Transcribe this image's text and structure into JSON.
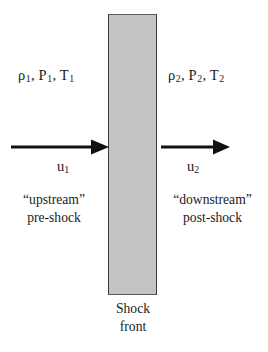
{
  "figure": {
    "background_color": "#ffffff",
    "ink_color": "#1a1a1a"
  },
  "shock_front": {
    "fill_color": "#c4c4c4",
    "edge_color": "#3a3a3a",
    "caption_line1": "Shock",
    "caption_line2": "front"
  },
  "upstream": {
    "state_rho": "ρ",
    "state_rho_sub": "1",
    "state_p": "P",
    "state_p_sub": "1",
    "state_t": "T",
    "state_t_sub": "1",
    "separator": ", ",
    "velocity_symbol": "u",
    "velocity_sub": "1",
    "caption_line1": "“upstream”",
    "caption_line2": "pre-shock"
  },
  "downstream": {
    "state_rho": "ρ",
    "state_rho_sub": "2",
    "state_p": "P",
    "state_p_sub": "2",
    "state_t": "T",
    "state_t_sub": "2",
    "separator": ", ",
    "velocity_symbol": "u",
    "velocity_sub": "2",
    "caption_line1": "“downstream”",
    "caption_line2": "post-shock"
  }
}
